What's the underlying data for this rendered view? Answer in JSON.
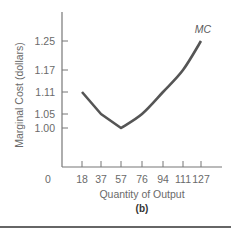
{
  "chart_data": {
    "type": "line",
    "title": "",
    "panel_label": "(b)",
    "xlabel": "Quantity of Output",
    "ylabel": "Marginal Cost (dollars)",
    "x_origin_label": "0",
    "x": [
      18,
      37,
      57,
      76,
      94,
      111,
      127
    ],
    "x_tick_labels": [
      "18",
      "37",
      "57",
      "76",
      "94",
      "111",
      "127"
    ],
    "y_tick_values": [
      1.0,
      1.05,
      1.11,
      1.17,
      1.25
    ],
    "y_tick_labels": [
      "1.00",
      "1.05",
      "1.11",
      "1.17",
      "1.25"
    ],
    "series": [
      {
        "name": "MC",
        "values": [
          1.11,
          1.05,
          1.0,
          1.05,
          1.11,
          1.17,
          1.25
        ],
        "color": "#555555"
      }
    ],
    "grid": false,
    "legend": "inline label at end of curve"
  },
  "colors": {
    "axis": "#777777",
    "curve": "#555555",
    "text": "#6a6a6a",
    "divider": "#333333"
  }
}
